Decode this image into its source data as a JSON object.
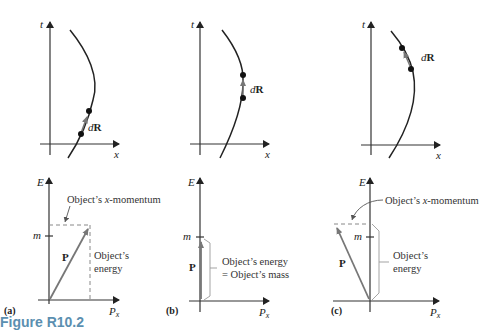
{
  "figure": {
    "caption": "Figure R10.2",
    "caption_color": "#5b8fb0",
    "panels": [
      {
        "id": "a",
        "label": "(a)",
        "spacetime": {
          "t_axis": "t",
          "x_axis": "x",
          "dR_label": "d",
          "dR_bold": "R"
        },
        "energy": {
          "e_axis": "E",
          "px_axis": "P",
          "px_sub": "x",
          "m_tick": "m",
          "P_label": "P",
          "annotation_top": "Object's x-momentum",
          "annotation_top_pre": "Object’s ",
          "annotation_top_var": "x",
          "annotation_top_post": "-momentum",
          "annotation_side_1": "Object’s",
          "annotation_side_2": "energy"
        }
      },
      {
        "id": "b",
        "label": "(b)",
        "spacetime": {
          "t_axis": "t",
          "x_axis": "x",
          "dR_label": "d",
          "dR_bold": "R"
        },
        "energy": {
          "e_axis": "E",
          "px_axis": "P",
          "px_sub": "x",
          "m_tick": "m",
          "P_label": "P",
          "annotation_side_1": "Object’s energy",
          "annotation_side_2": "= Object’s mass"
        }
      },
      {
        "id": "c",
        "label": "(c)",
        "spacetime": {
          "t_axis": "t",
          "x_axis": "x",
          "dR_label": "d",
          "dR_bold": "R"
        },
        "energy": {
          "e_axis": "E",
          "px_axis": "P",
          "px_sub": "x",
          "m_tick": "m",
          "P_label": "P",
          "annotation_top_pre": "Object’s ",
          "annotation_top_var": "x",
          "annotation_top_post": "-momentum",
          "annotation_side_1": "Object’s",
          "annotation_side_2": "energy"
        }
      }
    ]
  }
}
